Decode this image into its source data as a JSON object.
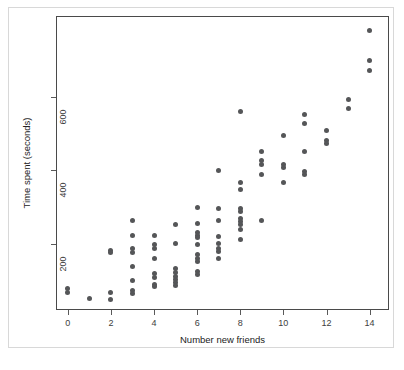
{
  "figure": {
    "background_color": "#ffffff",
    "frame_color": "#4a4a4a",
    "outer_border_color": "#d8d8d8",
    "point_color": "#555658"
  },
  "chart_data": {
    "type": "scatter",
    "title": "",
    "xlabel": "Number new friends",
    "ylabel": "Time spent (seconds)",
    "xlim": [
      -0.55,
      14.9
    ],
    "ylim": [
      20,
      820
    ],
    "grid": false,
    "legend": null,
    "xticks": [
      0,
      2,
      4,
      6,
      8,
      10,
      12,
      14
    ],
    "xticklabels": [
      "0",
      "2",
      "4",
      "6",
      "8",
      "10",
      "12",
      "14"
    ],
    "yticks": [
      200,
      400,
      600
    ],
    "yticklabels": [
      "200",
      "400",
      "600"
    ],
    "marker": "circle",
    "marker_size": 5,
    "points": [
      {
        "x": 0,
        "y": 78
      },
      {
        "x": 0,
        "y": 68
      },
      {
        "x": 1,
        "y": 52
      },
      {
        "x": 2,
        "y": 183
      },
      {
        "x": 2,
        "y": 176
      },
      {
        "x": 2,
        "y": 68
      },
      {
        "x": 2,
        "y": 48
      },
      {
        "x": 3,
        "y": 263
      },
      {
        "x": 3,
        "y": 224
      },
      {
        "x": 3,
        "y": 188
      },
      {
        "x": 3,
        "y": 176
      },
      {
        "x": 3,
        "y": 138
      },
      {
        "x": 3,
        "y": 100
      },
      {
        "x": 3,
        "y": 72
      },
      {
        "x": 3,
        "y": 64
      },
      {
        "x": 4,
        "y": 224
      },
      {
        "x": 4,
        "y": 197
      },
      {
        "x": 4,
        "y": 188
      },
      {
        "x": 4,
        "y": 160
      },
      {
        "x": 4,
        "y": 120
      },
      {
        "x": 4,
        "y": 108
      },
      {
        "x": 4,
        "y": 89
      },
      {
        "x": 4,
        "y": 83
      },
      {
        "x": 5,
        "y": 252
      },
      {
        "x": 5,
        "y": 200
      },
      {
        "x": 5,
        "y": 132
      },
      {
        "x": 5,
        "y": 122
      },
      {
        "x": 5,
        "y": 112
      },
      {
        "x": 5,
        "y": 104
      },
      {
        "x": 5,
        "y": 96
      },
      {
        "x": 5,
        "y": 88
      },
      {
        "x": 6,
        "y": 300
      },
      {
        "x": 6,
        "y": 256
      },
      {
        "x": 6,
        "y": 232
      },
      {
        "x": 6,
        "y": 224
      },
      {
        "x": 6,
        "y": 216
      },
      {
        "x": 6,
        "y": 197
      },
      {
        "x": 6,
        "y": 172
      },
      {
        "x": 6,
        "y": 160
      },
      {
        "x": 6,
        "y": 152
      },
      {
        "x": 6,
        "y": 124
      },
      {
        "x": 6,
        "y": 116
      },
      {
        "x": 7,
        "y": 400
      },
      {
        "x": 7,
        "y": 296
      },
      {
        "x": 7,
        "y": 264
      },
      {
        "x": 7,
        "y": 220
      },
      {
        "x": 7,
        "y": 200
      },
      {
        "x": 7,
        "y": 188
      },
      {
        "x": 7,
        "y": 180
      },
      {
        "x": 7,
        "y": 160
      },
      {
        "x": 8,
        "y": 560
      },
      {
        "x": 8,
        "y": 368
      },
      {
        "x": 8,
        "y": 348
      },
      {
        "x": 8,
        "y": 296
      },
      {
        "x": 8,
        "y": 288
      },
      {
        "x": 8,
        "y": 268
      },
      {
        "x": 8,
        "y": 260
      },
      {
        "x": 8,
        "y": 252
      },
      {
        "x": 8,
        "y": 240
      },
      {
        "x": 8,
        "y": 212
      },
      {
        "x": 9,
        "y": 452
      },
      {
        "x": 9,
        "y": 428
      },
      {
        "x": 9,
        "y": 416
      },
      {
        "x": 9,
        "y": 388
      },
      {
        "x": 9,
        "y": 264
      },
      {
        "x": 10,
        "y": 496
      },
      {
        "x": 10,
        "y": 416
      },
      {
        "x": 10,
        "y": 408
      },
      {
        "x": 10,
        "y": 368
      },
      {
        "x": 11,
        "y": 552
      },
      {
        "x": 11,
        "y": 528
      },
      {
        "x": 11,
        "y": 452
      },
      {
        "x": 11,
        "y": 396
      },
      {
        "x": 11,
        "y": 388
      },
      {
        "x": 12,
        "y": 508
      },
      {
        "x": 12,
        "y": 480
      },
      {
        "x": 12,
        "y": 472
      },
      {
        "x": 13,
        "y": 592
      },
      {
        "x": 13,
        "y": 568
      },
      {
        "x": 14,
        "y": 780
      },
      {
        "x": 14,
        "y": 700
      },
      {
        "x": 14,
        "y": 672
      }
    ]
  }
}
